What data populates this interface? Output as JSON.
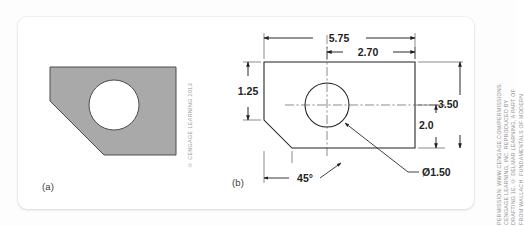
{
  "figure": {
    "panels": [
      {
        "id": "a",
        "caption": "(a)",
        "description": "shaded-pictorial-of-plate-with-hole",
        "fill_color": "#a9a9a9",
        "stroke_color": "#4a4a4a",
        "credit": "© CENGAGE LEARNING 2013"
      },
      {
        "id": "b",
        "caption": "(b)",
        "description": "dimensioned-orthographic-view-of-plate-with-hole",
        "stroke_color": "#1f1f1f"
      }
    ]
  },
  "dimensions": {
    "overall_width": "5.75",
    "hole_center_from_left": "2.70",
    "left_vertical_face": "1.25",
    "hole_center_from_bottom": "3.50",
    "lower_right_height": "2.0",
    "hole_diameter": "Ø1.50",
    "chamfer_angle": "45°"
  },
  "credits": {
    "panel_a": "© CENGAGE LEARNING 2013",
    "panel_b_lines": [
      "FROM WALLACH. FUNDAMENTALS OF MODERN",
      "DRAFTING 1E. © DELMAR LEARNING, A PART OF",
      "CENGAGE LEARNING, INC. REPRODUCED BY",
      "PERMISSION. WWW.CENGAGE.COM/PERMISSIONS."
    ]
  },
  "colors": {
    "card_background": "#ffffff",
    "page_background": "#fdfdfd",
    "shape_fill": "#a9a9a9",
    "line_color": "#1f1f1f",
    "credit_text": "#9b9b9b"
  }
}
